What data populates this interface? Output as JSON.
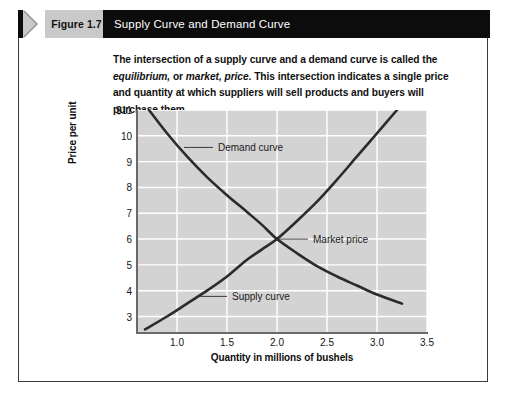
{
  "figure": {
    "number_label": "Figure 1.7",
    "title": "Supply Curve and Demand Curve",
    "chevron_icon": "chevron-right-icon"
  },
  "caption": {
    "line1_a": "The intersection of a supply curve and a demand curve is called the ",
    "line1_em": "equilibrium,",
    "line2_a": "or ",
    "line2_em": "market, price",
    "line2_b": ". This intersection indicates a single price and quantity at which",
    "line3": "suppliers will sell products and buyers will purchase them."
  },
  "colors": {
    "header_bg": "#0c0c0c",
    "tab_bg": "#c9c9c9",
    "plot_bg": "#d3d3d3",
    "grid": "#ffffff",
    "curve": "#2b2b2b",
    "axis": "#6a6a6a"
  },
  "chart_data": {
    "type": "line",
    "title": "Supply Curve and Demand Curve",
    "xlabel": "Quantity in millions of bushels",
    "ylabel": "Price per unit",
    "xlim": [
      0.6,
      3.5
    ],
    "ylim": [
      2.4,
      11
    ],
    "grid": true,
    "legend_position": "inline-annotations",
    "xticks": [
      "1.0",
      "1.5",
      "2.0",
      "2.5",
      "3.0",
      "3.5"
    ],
    "xtick_values": [
      1.0,
      1.5,
      2.0,
      2.5,
      3.0,
      3.5
    ],
    "yticks": [
      "$11",
      "10",
      "9",
      "8",
      "7",
      "6",
      "5",
      "4",
      "3"
    ],
    "ytick_values": [
      11,
      10,
      9,
      8,
      7,
      6,
      5,
      4,
      3
    ],
    "series": [
      {
        "name": "Demand curve",
        "label": "Demand curve",
        "x": [
          0.72,
          0.9,
          1.1,
          1.3,
          1.5,
          1.7,
          1.85,
          2.0,
          2.2,
          2.4,
          2.6,
          2.8,
          3.0,
          3.25
        ],
        "y": [
          11.0,
          10.1,
          9.2,
          8.4,
          7.7,
          7.05,
          6.55,
          6.0,
          5.45,
          4.95,
          4.55,
          4.2,
          3.85,
          3.5
        ]
      },
      {
        "name": "Supply curve",
        "label": "Supply curve",
        "x": [
          0.68,
          0.9,
          1.1,
          1.3,
          1.5,
          1.7,
          1.85,
          2.0,
          2.2,
          2.4,
          2.6,
          2.8,
          3.0,
          3.2
        ],
        "y": [
          2.5,
          3.0,
          3.5,
          4.0,
          4.55,
          5.2,
          5.6,
          6.0,
          6.7,
          7.45,
          8.3,
          9.2,
          10.1,
          11.0
        ]
      }
    ],
    "annotations": [
      {
        "name": "demand-curve-label",
        "text": "Demand curve",
        "x": 1.38,
        "y": 9.55,
        "leader_to_x": 1.07,
        "leader_to_y": 9.55
      },
      {
        "name": "market-price-label",
        "text": "Market price",
        "x": 2.33,
        "y": 6.0,
        "leader_to_x": 2.02,
        "leader_to_y": 6.0
      },
      {
        "name": "supply-curve-label",
        "text": "Supply curve",
        "x": 1.52,
        "y": 3.78,
        "leader_to_x": 1.23,
        "leader_to_y": 3.78
      }
    ],
    "equilibrium_point": {
      "x": 2.0,
      "y": 6.0,
      "label": "Market price"
    }
  }
}
